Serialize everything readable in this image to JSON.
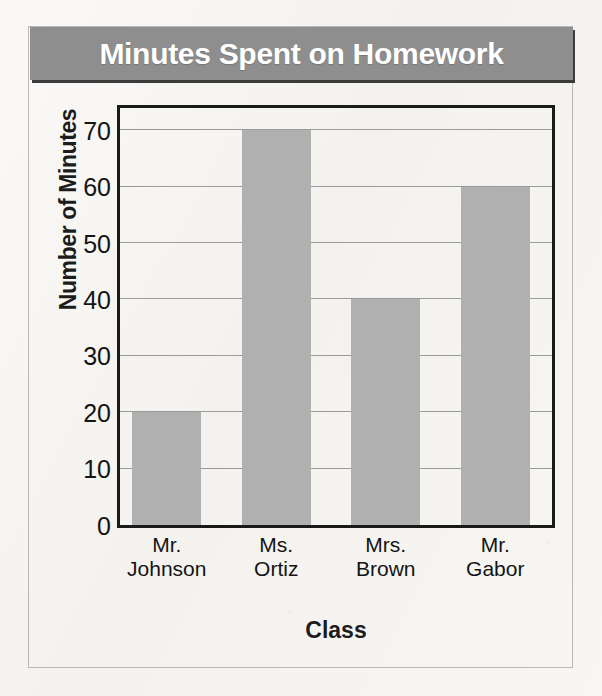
{
  "chart_data": {
    "type": "bar",
    "title": "Minutes Spent on Homework",
    "xlabel": "Class",
    "ylabel": "Number of Minutes",
    "categories": [
      "Mr. Johnson",
      "Ms. Ortiz",
      "Mrs. Brown",
      "Mr. Gabor"
    ],
    "category_lines": [
      [
        "Mr.",
        "Johnson"
      ],
      [
        "Ms.",
        "Ortiz"
      ],
      [
        "Mrs.",
        "Brown"
      ],
      [
        "Mr.",
        "Gabor"
      ]
    ],
    "values": [
      20,
      70,
      40,
      60
    ],
    "ylim": [
      0,
      75
    ],
    "yticks": [
      0,
      10,
      20,
      30,
      40,
      50,
      60,
      70
    ],
    "ytick_labels": [
      "0",
      "10",
      "20",
      "30",
      "40",
      "50",
      "60",
      "70"
    ],
    "grid": true,
    "grid_axis": "y",
    "legend": false
  },
  "style": {
    "bar_color": "#b0b0b0",
    "title_banner_color": "#8e8e8e",
    "title_text_color": "#ffffff",
    "axis_color": "#1a1a1a",
    "gridline_color": "#9a9a9a",
    "page_background": "#f6f5f2"
  }
}
